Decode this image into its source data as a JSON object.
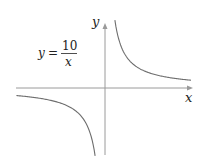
{
  "chart_data": {
    "type": "line",
    "title": "",
    "equation": {
      "lhs": "y",
      "equals": "=",
      "numerator": "10",
      "denominator": "x",
      "text": "y = 10/x"
    },
    "xlabel": "x",
    "ylabel": "y",
    "grid": false,
    "legend": "none",
    "series": [
      {
        "name": "y = 10/x (x > 0)",
        "x": [
          1.2,
          1.5,
          2,
          3,
          4,
          5,
          6,
          8,
          10
        ],
        "y": [
          8.33,
          6.67,
          5,
          3.33,
          2.5,
          2,
          1.67,
          1.25,
          1
        ]
      },
      {
        "name": "y = 10/x (x < 0)",
        "x": [
          -10,
          -8,
          -6,
          -5,
          -4,
          -3,
          -2,
          -1.5,
          -1.2
        ],
        "y": [
          -1,
          -1.25,
          -1.67,
          -2,
          -2.5,
          -3.33,
          -5,
          -6.67,
          -8.33
        ]
      }
    ],
    "xlim": [
      -10,
      10
    ],
    "ylim": [
      -8.5,
      8.5
    ],
    "axis_color": "#8a8a8a",
    "curve_color": "#6e6e6e"
  }
}
